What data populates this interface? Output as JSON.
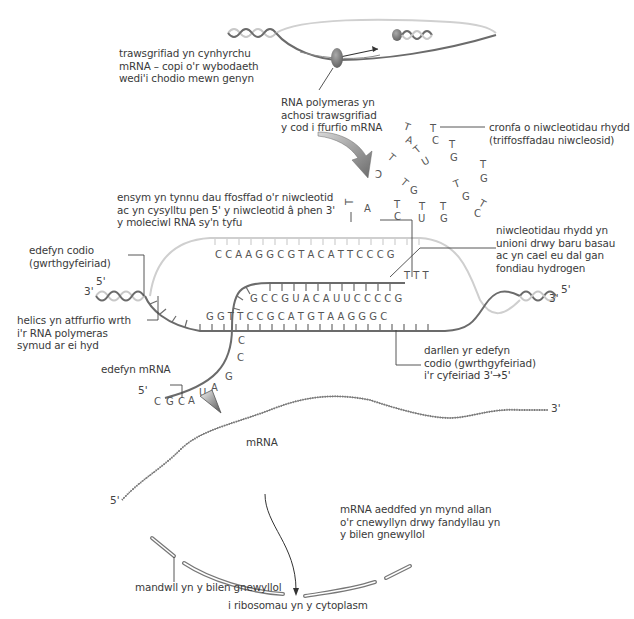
{
  "diagram": {
    "type": "transcription-process",
    "language": "Welsh",
    "labels": {
      "transcription": [
        "trawsgrifiad yn cynhyrchu",
        "mRNA – copi o'r wybodaeth",
        "wedi'i chodio mewn genyn"
      ],
      "rna_polymerase": [
        "RNA polymeras yn",
        "achosi trawsgrifiad",
        "y cod i ffurfio mRNA"
      ],
      "nucleotide_pool": [
        "cronfa o niwcleotidau rhydd",
        "(triffosffadau niwcleosid)"
      ],
      "enzyme": [
        "ensym yn tynnu dau ffosffad o'r niwcleotid",
        "ac yn cysylltu pen 5' y niwcleotid â phen 3'",
        "y moleciwl RNA sy'n tyfu"
      ],
      "free_nucleotides_align": [
        "niwcleotidau rhydd yn",
        "unioni drwy baru basau",
        "ac yn cael eu dal gan",
        "fondiau hydrogen"
      ],
      "coding_strand": [
        "edefyn codio",
        "(gwrthgyfeiriad)"
      ],
      "helix_reforms": [
        "helics yn atffurfio wrth",
        "i'r RNA polymeras",
        "symud ar ei hyd"
      ],
      "read_strand": [
        "darllen yr edefyn",
        "codio (gwrthgyfeiriad)",
        "i'r cyfeiriad 3'→5'"
      ],
      "mrna_strand": "edefyn mRNA",
      "mrna": "mRNA",
      "mature_mrna": [
        "mRNA aeddfed yn mynd allan",
        "o'r cnewyllyn drwy fandyllau yn",
        "y bilen gnewyllol"
      ],
      "nuclear_pore": "mandwll yn y bilen gnewyllol",
      "to_ribosomes": "i ribosomau yn y cytoplasm"
    },
    "strand_ends": {
      "left_top": "5'",
      "left_bottom": "3'",
      "right_top": "5'",
      "right_bottom": "3'",
      "mrna_strand_start": "5'",
      "mrna_left": "5'",
      "mrna_right": "3'"
    },
    "bases": {
      "template_top_row": "CCAAGGCG TACAT TCCCG",
      "new_rna_top_row": "GCCGUACAUUCCCCG",
      "template_bottom_row": "GGT TCCGCAT GTAAGGGC",
      "mrna_tail": [
        "C",
        "C",
        "G",
        "A",
        "U",
        "A",
        "C",
        "G",
        "C"
      ],
      "incoming_T": [
        "T",
        "T",
        "T"
      ],
      "free_nucleotides": [
        "TC",
        "TA",
        "TC",
        "TU",
        "TG",
        "TG",
        "TG",
        "TG",
        "TC",
        "TU",
        "TG",
        "TC",
        "TA"
      ]
    },
    "colors": {
      "dna_dark": "#6b6b6b",
      "dna_light": "#c8c8c8",
      "polymerase": "#7a7a7a",
      "text": "#3a3a3a"
    }
  }
}
